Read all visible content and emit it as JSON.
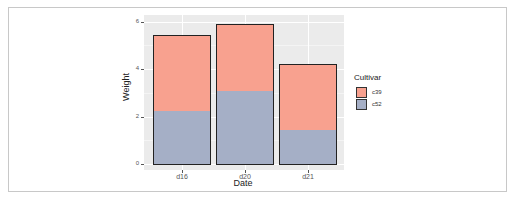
{
  "chart_data": {
    "type": "bar",
    "stacked": true,
    "title": "",
    "xlabel": "Date",
    "ylabel": "Weight",
    "categories": [
      "d16",
      "d20",
      "d21"
    ],
    "series": [
      {
        "name": "c39",
        "values": [
          3.18,
          2.8,
          2.74
        ],
        "color": "#f8a18f"
      },
      {
        "name": "c52",
        "values": [
          2.26,
          3.11,
          1.47
        ],
        "color": "#a5afc6"
      }
    ],
    "totals": [
      5.44,
      5.91,
      4.21
    ],
    "ylim": [
      0,
      6.3
    ],
    "yticks": [
      "0",
      "2",
      "4",
      "6"
    ],
    "grid": true,
    "legend": {
      "title": "Cultivar",
      "position": "right",
      "entries": [
        "c39",
        "c52"
      ]
    }
  }
}
